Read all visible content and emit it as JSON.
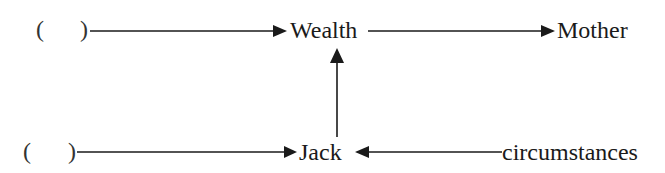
{
  "diagram": {
    "top_row": {
      "blank": {
        "open": "(",
        "close": ")"
      },
      "nodes": [
        {
          "id": "wealth",
          "label": "Wealth"
        },
        {
          "id": "mother",
          "label": "Mother"
        }
      ]
    },
    "bottom_row": {
      "blank": {
        "open": "(",
        "close": ")"
      },
      "nodes": [
        {
          "id": "jack",
          "label": "Jack"
        },
        {
          "id": "circumstances",
          "label": "circumstances"
        }
      ]
    },
    "edges": [
      {
        "from": "top-blank",
        "to": "wealth"
      },
      {
        "from": "wealth",
        "to": "mother"
      },
      {
        "from": "jack",
        "to": "wealth"
      },
      {
        "from": "bottom-blank",
        "to": "jack"
      },
      {
        "from": "circumstances",
        "to": "jack"
      }
    ],
    "colors": {
      "line": "#1a1a1a",
      "text": "#1a1a1a",
      "background": "#ffffff"
    }
  }
}
